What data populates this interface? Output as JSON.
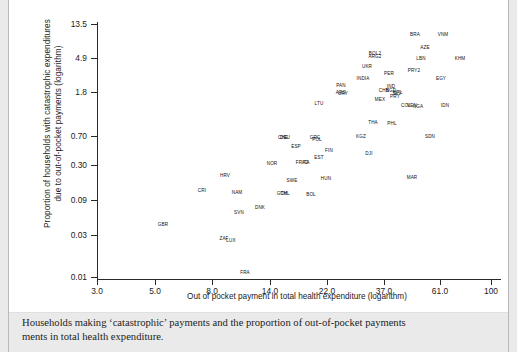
{
  "figure": {
    "ylabel_line1": "Proportion of households with catastrophic expenditures",
    "ylabel_line2": "due to out-of-pocket payments (logarithm)",
    "xlabel": "Out of pocket payment in total health expenditure (logarithm)",
    "caption_line1": "Households making ‘catastrophic’ payments and the proportion of out-of-pocket payments",
    "caption_line2": "ments in total health expenditure.",
    "axis_color": "#2b2b2b",
    "panel_color": "#ffffff",
    "page_color": "#eaeaea"
  },
  "chart_data": {
    "type": "scatter",
    "title": "",
    "xlabel": "Out of pocket payment in total health expenditure (logarithm)",
    "ylabel": "Proportion of households with catastrophic expenditures due to out-of-pocket payments (logarithm)",
    "xscale": "log",
    "yscale": "log",
    "grid": false,
    "legend": null,
    "xticks": [
      "3.0",
      "5.0",
      "8.0",
      "14.0",
      "22.0",
      "37.0",
      "61.0",
      "100"
    ],
    "xtick_values": [
      3.0,
      5.0,
      8.0,
      14.0,
      22.0,
      37.0,
      61.0,
      100
    ],
    "yticks": [
      "13.5",
      "4.9",
      "1.8",
      "0.70",
      "0.30",
      "0.09",
      "0.03",
      "0.01"
    ],
    "ytick_values": [
      13.5,
      4.9,
      1.8,
      0.7,
      0.3,
      0.09,
      0.03,
      0.01
    ],
    "xlim": [
      3.0,
      100
    ],
    "ylim": [
      0.01,
      13.5
    ],
    "marker": "text-label",
    "points": [
      {
        "label": "GBR",
        "px": 154,
        "py": 224
      },
      {
        "label": "ZAF",
        "px": 215,
        "py": 238
      },
      {
        "label": "LUX",
        "px": 222,
        "py": 240
      },
      {
        "label": "FRA",
        "px": 236,
        "py": 272
      },
      {
        "label": "SVN",
        "px": 230,
        "py": 212
      },
      {
        "label": "DNK",
        "px": 251,
        "py": 207
      },
      {
        "label": "CRI",
        "px": 193,
        "py": 190
      },
      {
        "label": "NAM",
        "px": 228,
        "py": 192
      },
      {
        "label": "HRV",
        "px": 216,
        "py": 175
      },
      {
        "label": "CHL",
        "px": 276,
        "py": 193
      },
      {
        "label": "GTM",
        "px": 273,
        "py": 193
      },
      {
        "label": "BOL",
        "px": 302,
        "py": 194
      },
      {
        "label": "SWE",
        "px": 283,
        "py": 180
      },
      {
        "label": "HUN",
        "px": 317,
        "py": 178
      },
      {
        "label": "NOR",
        "px": 263,
        "py": 163
      },
      {
        "label": "FRA2",
        "px": 293,
        "py": 162
      },
      {
        "label": "ITA",
        "px": 297,
        "py": 162
      },
      {
        "label": "EST",
        "px": 310,
        "py": 157
      },
      {
        "label": "FIN",
        "px": 320,
        "py": 150
      },
      {
        "label": "ESP",
        "px": 287,
        "py": 146
      },
      {
        "label": "CHE",
        "px": 274,
        "py": 137
      },
      {
        "label": "DEU",
        "px": 276,
        "py": 137
      },
      {
        "label": "GRC",
        "px": 306,
        "py": 137
      },
      {
        "label": "POL",
        "px": 308,
        "py": 139
      },
      {
        "label": "KGZ",
        "px": 352,
        "py": 136
      },
      {
        "label": "DJI",
        "px": 360,
        "py": 153
      },
      {
        "label": "SDN",
        "px": 421,
        "py": 136
      },
      {
        "label": "MAR",
        "px": 403,
        "py": 177
      },
      {
        "label": "THA",
        "px": 364,
        "py": 122
      },
      {
        "label": "PHL",
        "px": 383,
        "py": 123
      },
      {
        "label": "LTU",
        "px": 310,
        "py": 103
      },
      {
        "label": "PAN",
        "px": 332,
        "py": 85
      },
      {
        "label": "ARG",
        "px": 332,
        "py": 92
      },
      {
        "label": "URY",
        "px": 334,
        "py": 93
      },
      {
        "label": "MEX",
        "px": 371,
        "py": 99
      },
      {
        "label": "CHN",
        "px": 375,
        "py": 90
      },
      {
        "label": "IND",
        "px": 382,
        "py": 86
      },
      {
        "label": "BGD",
        "px": 382,
        "py": 90
      },
      {
        "label": "SLV",
        "px": 388,
        "py": 93
      },
      {
        "label": "NPL",
        "px": 389,
        "py": 92
      },
      {
        "label": "PRY",
        "px": 386,
        "py": 96
      },
      {
        "label": "COL",
        "px": 397,
        "py": 105
      },
      {
        "label": "VEN",
        "px": 403,
        "py": 105
      },
      {
        "label": "NGA",
        "px": 409,
        "py": 106
      },
      {
        "label": "IDN",
        "px": 436,
        "py": 105
      },
      {
        "label": "INDIA",
        "px": 354,
        "py": 78
      },
      {
        "label": "UKR",
        "px": 358,
        "py": 66
      },
      {
        "label": "PER",
        "px": 380,
        "py": 73
      },
      {
        "label": "PRY2",
        "px": 405,
        "py": 70
      },
      {
        "label": "EGY",
        "px": 432,
        "py": 78
      },
      {
        "label": "BOL2",
        "px": 366,
        "py": 53
      },
      {
        "label": "ARG2",
        "px": 366,
        "py": 56
      },
      {
        "label": "LBN",
        "px": 412,
        "py": 58
      },
      {
        "label": "AZE",
        "px": 416,
        "py": 47
      },
      {
        "label": "KHM",
        "px": 451,
        "py": 58
      },
      {
        "label": "BRA",
        "px": 406,
        "py": 34
      },
      {
        "label": "VNM",
        "px": 434,
        "py": 34
      }
    ]
  }
}
